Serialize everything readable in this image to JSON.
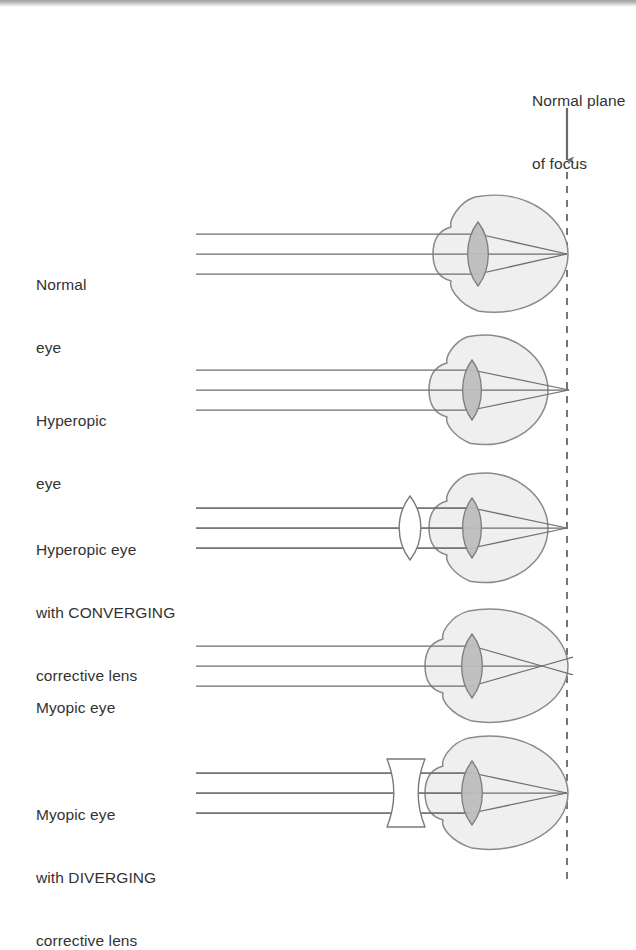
{
  "figure": {
    "plane_label": {
      "line1": "Normal plane",
      "line2": "of focus",
      "x": 532,
      "y": 48
    },
    "focus_plane": {
      "name": "normal-plane-of-focus",
      "x": 567,
      "line_top": 172,
      "line_bottom": 882,
      "dash": "7 7",
      "color": "#6f6f6f",
      "arrow": {
        "x": 567,
        "y_start": 108,
        "y_end": 160,
        "color": "#6a6a6a"
      }
    },
    "colors": {
      "eyeball_fill": "#efefef",
      "eyeball_stroke": "#8a8a8a",
      "lens_fill": "#bdbdbd",
      "lens_stroke": "#7d7d7d",
      "corrective_lens_fill": "#ffffff",
      "corrective_lens_stroke": "#7a7a7a",
      "ray_color": "#6e6e6e",
      "text_color": "#333333"
    },
    "ray_origin_x": 196,
    "rows": [
      {
        "id": "normal-eye",
        "label_lines": [
          "Normal",
          "eye"
        ],
        "label_x": 36,
        "label_y": 232,
        "axis_y": 254,
        "eye": {
          "type": "normal",
          "cx": 508,
          "cy": 254,
          "rx": 60,
          "ry": 60,
          "lens_cx": 478,
          "lens_half_height": 32,
          "lens_half_width": 11
        },
        "focus_x": 567,
        "focus_on_plane": true,
        "rays_offsets": [
          -20,
          0,
          20
        ],
        "corrective_lens": null
      },
      {
        "id": "hyperopic-eye",
        "label_lines": [
          "Hyperopic",
          "eye"
        ],
        "label_x": 36,
        "label_y": 368,
        "axis_y": 390,
        "eye": {
          "type": "hyperopic",
          "cx": 496,
          "cy": 390,
          "rx": 52,
          "ry": 56,
          "lens_cx": 472,
          "lens_half_height": 30,
          "lens_half_width": 10
        },
        "focus_x": 569,
        "focus_on_plane": false,
        "rays_offsets": [
          -20,
          0,
          20
        ],
        "corrective_lens": null
      },
      {
        "id": "hyperopic-eye-corrected",
        "label_lines": [
          "Hyperopic eye",
          "with CONVERGING",
          "corrective lens"
        ],
        "label_x": 36,
        "label_y": 497,
        "axis_y": 528,
        "eye": {
          "type": "hyperopic",
          "cx": 496,
          "cy": 528,
          "rx": 52,
          "ry": 56,
          "lens_cx": 472,
          "lens_half_height": 30,
          "lens_half_width": 10
        },
        "focus_x": 567,
        "focus_on_plane": true,
        "rays_offsets": [
          -20,
          0,
          20
        ],
        "corrective_lens": {
          "type": "converging",
          "shape": "biconvex",
          "cx": 410,
          "half_height": 32,
          "half_width": 9
        }
      },
      {
        "id": "myopic-eye",
        "label_lines": [
          "Myopic eye"
        ],
        "label_x": 36,
        "label_y": 655,
        "axis_y": 666,
        "eye": {
          "type": "myopic",
          "cx": 504,
          "cy": 666,
          "rx": 64,
          "ry": 58,
          "lens_cx": 472,
          "lens_half_height": 32,
          "lens_half_width": 11
        },
        "focus_x": 542,
        "focus_on_plane": false,
        "rays_offsets": [
          -20,
          0,
          20
        ],
        "corrective_lens": null
      },
      {
        "id": "myopic-eye-corrected",
        "label_lines": [
          "Myopic eye",
          "with DIVERGING",
          "corrective lens"
        ],
        "label_x": 36,
        "label_y": 762,
        "axis_y": 793,
        "eye": {
          "type": "myopic",
          "cx": 504,
          "cy": 793,
          "rx": 64,
          "ry": 58,
          "lens_cx": 472,
          "lens_half_height": 32,
          "lens_half_width": 11
        },
        "focus_x": 567,
        "focus_on_plane": true,
        "rays_offsets": [
          -20,
          0,
          20
        ],
        "corrective_lens": {
          "type": "diverging",
          "shape": "biconcave",
          "cx": 406,
          "half_height": 34,
          "half_width": 11
        }
      }
    ]
  }
}
